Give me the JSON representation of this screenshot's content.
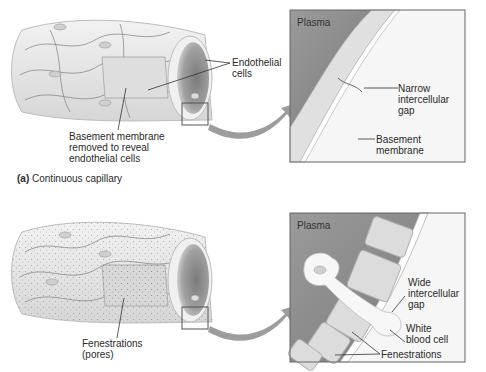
{
  "panels": [
    {
      "id": "a",
      "caption_letter": "(a)",
      "caption_text": "Continuous capillary",
      "labels": {
        "endothelial": [
          "Endothelial",
          "cells"
        ],
        "basement_removed": [
          "Basement membrane",
          "removed to reveal",
          "endothelial cells"
        ]
      },
      "detail": {
        "plasma": "Plasma",
        "gap": [
          "Narrow",
          "intercellular",
          "gap"
        ],
        "basement": [
          "Basement",
          "membrane"
        ]
      }
    },
    {
      "id": "b",
      "labels": {
        "fenestrations": [
          "Fenestrations",
          "(pores)"
        ]
      },
      "detail": {
        "plasma": "Plasma",
        "gap": [
          "Wide",
          "intercellular",
          "gap"
        ],
        "wbc": [
          "White",
          "blood cell"
        ],
        "fenestrations": "Fenestrations"
      }
    }
  ],
  "colors": {
    "plasma": "#8a8a8a",
    "cell": "#dcdcdc",
    "tube": "#e9e9e9",
    "line": "#555555",
    "arrow": "#999999"
  }
}
